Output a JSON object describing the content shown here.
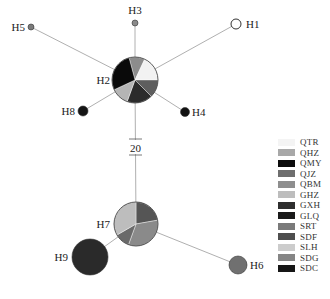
{
  "diagram": {
    "type": "haplotype-network",
    "mutation_label": "20",
    "line_color": "#b0b0b0",
    "haplotypes": [
      {
        "id": "H1",
        "label": "H1",
        "x": 236,
        "y": 24,
        "r": 5,
        "fill": "#ffffff",
        "stroke": "#333333"
      },
      {
        "id": "H2",
        "label": "H2",
        "x": 135,
        "y": 80,
        "r": 23,
        "pie": true
      },
      {
        "id": "H3",
        "label": "H3",
        "x": 135,
        "y": 23,
        "r": 3,
        "fill": "#8a8a8a"
      },
      {
        "id": "H4",
        "label": "H4",
        "x": 185,
        "y": 112,
        "r": 4.5,
        "fill": "#111111"
      },
      {
        "id": "H5",
        "label": "H5",
        "x": 31,
        "y": 27,
        "r": 3,
        "fill": "#7a7a7a"
      },
      {
        "id": "H6",
        "label": "H6",
        "x": 238,
        "y": 265,
        "r": 9,
        "fill": "#707070"
      },
      {
        "id": "H7",
        "label": "H7",
        "x": 136,
        "y": 224,
        "r": 22,
        "pie": true
      },
      {
        "id": "H8",
        "label": "H8",
        "x": 83,
        "y": 111,
        "r": 5,
        "fill": "#151515"
      },
      {
        "id": "H9",
        "label": "H9",
        "x": 90,
        "y": 257,
        "r": 18,
        "fill": "#2a2a2a"
      }
    ],
    "pies": {
      "H2": [
        {
          "from": -15,
          "to": 25,
          "fill": "#8c8c8c"
        },
        {
          "from": 25,
          "to": 90,
          "fill": "#f2f2f2"
        },
        {
          "from": 90,
          "to": 135,
          "fill": "#5e5e5e"
        },
        {
          "from": 135,
          "to": 200,
          "fill": "#2b2b2b"
        },
        {
          "from": 200,
          "to": 245,
          "fill": "#b5b5b5"
        },
        {
          "from": 245,
          "to": 345,
          "fill": "#0a0a0a"
        }
      ],
      "H7": [
        {
          "from": 0,
          "to": 80,
          "fill": "#555555"
        },
        {
          "from": 80,
          "to": 200,
          "fill": "#8a8a8a"
        },
        {
          "from": 200,
          "to": 240,
          "fill": "#6a6a6a"
        },
        {
          "from": 240,
          "to": 360,
          "fill": "#bdbdbd"
        }
      ]
    },
    "edges": [
      [
        "H2",
        "H1"
      ],
      [
        "H2",
        "H3"
      ],
      [
        "H2",
        "H4"
      ],
      [
        "H2",
        "H5"
      ],
      [
        "H2",
        "H8"
      ],
      [
        "H2",
        "H7"
      ],
      [
        "H7",
        "H9"
      ],
      [
        "H7",
        "H6"
      ]
    ]
  },
  "legend": {
    "items": [
      {
        "label": "QTR",
        "color": "#f4f4f4"
      },
      {
        "label": "QHZ",
        "color": "#a8a8a8"
      },
      {
        "label": "QMY",
        "color": "#0c0c0c"
      },
      {
        "label": "QJZ",
        "color": "#6e6e6e"
      },
      {
        "label": "QBM",
        "color": "#8e8e8e"
      },
      {
        "label": "GHZ",
        "color": "#bdbdbd"
      },
      {
        "label": "GXH",
        "color": "#2e2e2e"
      },
      {
        "label": "GLQ",
        "color": "#1a1a1a"
      },
      {
        "label": "SRT",
        "color": "#7a7a7a"
      },
      {
        "label": "SDF",
        "color": "#4e4e4e"
      },
      {
        "label": "SLH",
        "color": "#cccccc"
      },
      {
        "label": "SDG",
        "color": "#858585"
      },
      {
        "label": "SDC",
        "color": "#161616"
      }
    ]
  }
}
